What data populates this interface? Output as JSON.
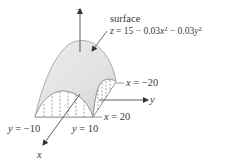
{
  "figure": {
    "title_label": "surface",
    "equation": {
      "lhs": "z",
      "rhs_text": "= 15 − 0.03x² − 0.03y²",
      "parts": [
        "z",
        " = 15 − 0.03",
        "x",
        "2",
        " − 0.03",
        "y",
        "2"
      ]
    },
    "axes": {
      "z": "z",
      "y": "y",
      "x": "x"
    },
    "boundary_labels": {
      "x_neg": "x = −20",
      "x_neg_var": "x",
      "x_neg_val": " = −20",
      "x_pos": "x = 20",
      "x_pos_var": "x",
      "x_pos_val": " = 20",
      "y_neg": "y = −10",
      "y_neg_var": "y",
      "y_neg_val": " = −10",
      "y_pos": "y = 10",
      "y_pos_var": "y",
      "y_pos_val": " = 10"
    },
    "colors": {
      "surface_fill": "#e4e4e4",
      "surface_edge": "#9a9a9a",
      "axis": "#333333",
      "text": "#3a3a3a"
    }
  }
}
